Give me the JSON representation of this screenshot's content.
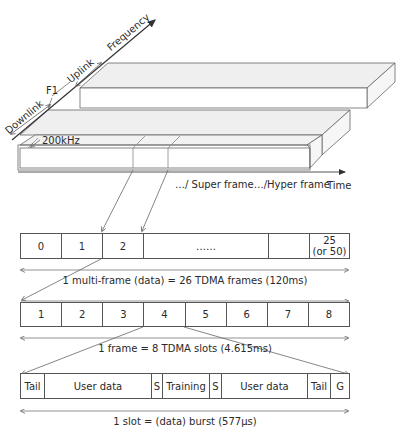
{
  "axes": {
    "frequency_label": "Frequency",
    "time_label": "Time",
    "uplink_label": "Uplink",
    "downlink_label": "Downlink",
    "carrier_label": "F1",
    "bandwidth_label": "200kHz"
  },
  "superframe_caption": "…/ Super frame…/Hyper frame",
  "multiframe": {
    "cells": [
      "0",
      "1",
      "2",
      "……",
      "",
      "25\n(or 50)"
    ],
    "cell_last_line1": "25",
    "cell_last_line2": "(or 50)",
    "caption": "1 multi-frame (data) = 26 TDMA frames (120ms)"
  },
  "frame": {
    "cells": [
      "1",
      "2",
      "3",
      "4",
      "5",
      "6",
      "7",
      "8"
    ],
    "caption": "1 frame = 8 TDMA slots (4.615ms)"
  },
  "slot": {
    "cells": [
      "Tail",
      "User data",
      "S",
      "Training",
      "S",
      "User data",
      "Tail",
      "G"
    ],
    "caption": "1 slot = (data) burst (577µs)"
  },
  "colors": {
    "line": "#555555",
    "slab_top": "#efefef",
    "slab_front": "#ffffff",
    "arrow": "#333333"
  }
}
